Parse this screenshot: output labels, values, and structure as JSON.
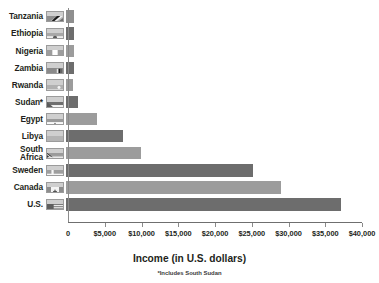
{
  "chart_data": {
    "type": "bar",
    "orientation": "horizontal",
    "title": "",
    "xlabel": "Income (in U.S. dollars)",
    "ylabel": "",
    "footnote": "*Includes South Sudan",
    "xlim": [
      0,
      40000
    ],
    "xticks": [
      0,
      5000,
      10000,
      15000,
      20000,
      25000,
      30000,
      35000,
      40000
    ],
    "xtick_labels": [
      "0",
      "$5,000",
      "$10,000",
      "$15,000",
      "$20,000",
      "$25,000",
      "$30,000",
      "$35,000",
      "$40,000"
    ],
    "grid": false,
    "legend": "none",
    "categories": [
      "Tanzania",
      "Ethiopia",
      "Nigeria",
      "Zambia",
      "Rwanda",
      "Sudan*",
      "Egypt",
      "Libya",
      "South\nAfrica",
      "Sweden",
      "Canada",
      "U.S."
    ],
    "values": [
      1100,
      1150,
      1100,
      1150,
      950,
      1600,
      4200,
      7700,
      10200,
      25400,
      29200,
      37400
    ],
    "bar_colors": [
      "#8f8f8f",
      "#6d6d6d",
      "#9c9c9c",
      "#6d6d6d",
      "#9c9c9c",
      "#6d6d6d",
      "#9c9c9c",
      "#6d6d6d",
      "#9c9c9c",
      "#6d6d6d",
      "#9c9c9c",
      "#6d6d6d"
    ],
    "flags": [
      "tanzania-flag",
      "ethiopia-flag",
      "nigeria-flag",
      "zambia-flag",
      "rwanda-flag",
      "sudan-flag",
      "egypt-flag",
      "libya-flag",
      "south-africa-flag",
      "sweden-flag",
      "canada-flag",
      "united-states-flag"
    ]
  },
  "colors": {
    "background": "#ffffff",
    "text": "#231f20",
    "axis": "#8b8b8b",
    "bar_dark": "#6d6d6d",
    "bar_light": "#9c9c9c"
  }
}
